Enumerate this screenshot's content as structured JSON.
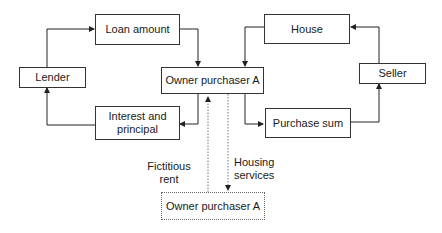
{
  "diagram": {
    "nodes": {
      "loan_amount": "Loan amount",
      "lender": "Lender",
      "owner_purchaser_top": "Owner purchaser A",
      "interest_principal": "Interest and principal",
      "house": "House",
      "seller": "Seller",
      "purchase_sum": "Purchase sum",
      "owner_purchaser_bottom": "Owner purchaser A"
    },
    "edge_labels": {
      "fictitious_rent": "Fictitious rent",
      "housing_services": "Housing services"
    },
    "edges": [
      {
        "from": "lender",
        "to": "loan_amount",
        "style": "solid"
      },
      {
        "from": "loan_amount",
        "to": "owner_purchaser_top",
        "style": "solid"
      },
      {
        "from": "owner_purchaser_top",
        "to": "interest_principal",
        "style": "solid"
      },
      {
        "from": "interest_principal",
        "to": "lender",
        "style": "solid"
      },
      {
        "from": "house",
        "to": "owner_purchaser_top",
        "style": "solid"
      },
      {
        "from": "owner_purchaser_top",
        "to": "purchase_sum",
        "style": "solid"
      },
      {
        "from": "purchase_sum",
        "to": "seller",
        "style": "solid"
      },
      {
        "from": "seller",
        "to": "house",
        "style": "solid"
      },
      {
        "from": "owner_purchaser_bottom",
        "to": "owner_purchaser_top",
        "style": "dotted",
        "label": "fictitious_rent"
      },
      {
        "from": "owner_purchaser_top",
        "to": "owner_purchaser_bottom",
        "style": "dotted",
        "label": "housing_services"
      }
    ]
  }
}
